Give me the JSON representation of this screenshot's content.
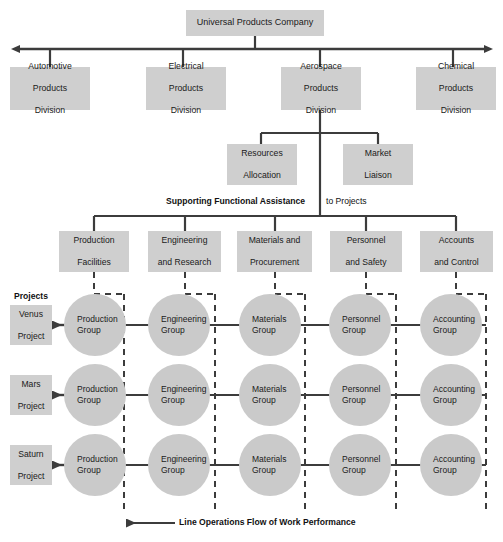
{
  "diagram": {
    "title_partial": "",
    "root": {
      "label": "Universal Products Company"
    },
    "divisions": [
      {
        "label": "Automotive\nProducts\nDivision",
        "line1": "Automotive",
        "line2": "Products",
        "line3": "Division"
      },
      {
        "label": "Electrical\nProducts\nDivision",
        "line1": "Electrical",
        "line2": "Products",
        "line3": "Division"
      },
      {
        "label": "Aerospace\nProducts\nDivision",
        "line1": "Aerospace",
        "line2": "Products",
        "line3": "Division"
      },
      {
        "label": "Chemical\nProducts\nDivision",
        "line1": "Chemical",
        "line2": "Products",
        "line3": "Division"
      }
    ],
    "staff_units": [
      {
        "line1": "Resources",
        "line2": "Allocation"
      },
      {
        "line1": "Market",
        "line2": "Liaison"
      }
    ],
    "functional_band_label": {
      "bold_part": "Supporting Functional Assistance",
      "plain_part": "to Projects"
    },
    "functions": [
      {
        "line1": "Production",
        "line2": "Facilities"
      },
      {
        "line1": "Engineering",
        "line2": "and Research"
      },
      {
        "line1": "Materials and",
        "line2": "Procurement"
      },
      {
        "line1": "Personnel",
        "line2": "and Safety"
      },
      {
        "line1": "Accounts",
        "line2": "and Control"
      }
    ],
    "projects_section_label": "Projects",
    "projects": [
      {
        "line1": "Venus",
        "line2": "Project"
      },
      {
        "line1": "Mars",
        "line2": "Project"
      },
      {
        "line1": "Saturn",
        "line2": "Project"
      }
    ],
    "groups": [
      {
        "line1": "Production",
        "line2": "Group"
      },
      {
        "line1": "Engineering",
        "line2": "Group"
      },
      {
        "line1": "Materials",
        "line2": "Group"
      },
      {
        "line1": "Personnel",
        "line2": "Group"
      },
      {
        "line1": "Accounting",
        "line2": "Group"
      }
    ],
    "bottom_caption": "Line Operations Flow of Work Performance",
    "colors": {
      "box_fill": "#cfcfcf",
      "circle_fill": "#cacaca",
      "line": "#3c3c3c",
      "text": "#1a1a1a",
      "background": "#ffffff"
    }
  }
}
